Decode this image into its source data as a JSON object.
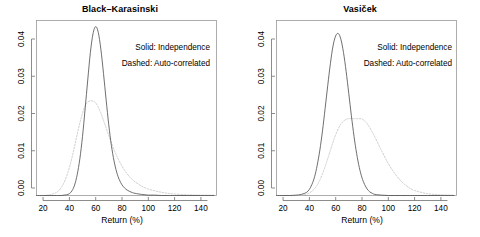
{
  "figure": {
    "background_color": "#ffffff",
    "width": 480,
    "height": 237,
    "panel_count": 2
  },
  "axis": {
    "xlabel": "Return (%)",
    "ylabel": "",
    "x_ticks": [
      "20",
      "40",
      "60",
      "80",
      "100",
      "120",
      "140"
    ],
    "y_ticks": [
      "0.00",
      "0.01",
      "0.02",
      "0.03",
      "0.04"
    ],
    "xlim": [
      15,
      152
    ],
    "ylim": [
      0,
      0.0485
    ],
    "grid": false
  },
  "legend": {
    "position": "top-right-inside",
    "solid_label": "Solid: Independence",
    "dashed_label": "Dashed: Auto-correlated",
    "solid_color": "#555555",
    "dashed_color": "#c9c9c9"
  },
  "chart_data": [
    {
      "type": "line",
      "title": "Black–Karasinski",
      "xlabel": "Return (%)",
      "ylabel": "",
      "xlim": [
        15,
        152
      ],
      "ylim": [
        0,
        0.0485
      ],
      "grid": false,
      "legend_position": "top-right-inside",
      "x": [
        15,
        20,
        25,
        30,
        32,
        34,
        36,
        38,
        40,
        42,
        44,
        46,
        48,
        50,
        52,
        54,
        56,
        58,
        60,
        62,
        64,
        66,
        68,
        70,
        72,
        74,
        76,
        78,
        80,
        82,
        84,
        86,
        88,
        90,
        95,
        100,
        105,
        110,
        115,
        120,
        130,
        140,
        150
      ],
      "series": [
        {
          "name": "Independence",
          "style": "solid",
          "color": "#555555",
          "peak_x": 60,
          "peak_y": 0.0468,
          "values": [
            0.0,
            0.0,
            0.0,
            0.0,
            0.0,
            0.0,
            0.0001,
            0.0002,
            0.0005,
            0.0013,
            0.0029,
            0.0058,
            0.0102,
            0.0163,
            0.024,
            0.032,
            0.0396,
            0.0448,
            0.0468,
            0.0452,
            0.0405,
            0.0338,
            0.0265,
            0.0196,
            0.0139,
            0.0096,
            0.0065,
            0.0044,
            0.003,
            0.0021,
            0.0015,
            0.0011,
            0.0008,
            0.0006,
            0.0003,
            0.0001,
            0.0001,
            0.0,
            0.0,
            0.0,
            0.0,
            0.0,
            0.0
          ]
        },
        {
          "name": "Auto-correlated",
          "style": "dashed",
          "color": "#c9c9c9",
          "peak_x": 58,
          "peak_y": 0.0262,
          "values": [
            0.0,
            0.0,
            0.0002,
            0.0008,
            0.0014,
            0.0023,
            0.0036,
            0.0054,
            0.0077,
            0.0105,
            0.0137,
            0.017,
            0.0201,
            0.0228,
            0.0248,
            0.0259,
            0.0262,
            0.0262,
            0.0257,
            0.0245,
            0.0228,
            0.0208,
            0.0187,
            0.0166,
            0.0146,
            0.0127,
            0.011,
            0.0095,
            0.0082,
            0.007,
            0.006,
            0.0051,
            0.0044,
            0.0038,
            0.0026,
            0.0018,
            0.0013,
            0.0009,
            0.0006,
            0.0004,
            0.0002,
            0.0001,
            0.0001
          ]
        }
      ]
    },
    {
      "type": "line",
      "title": "Vasiček",
      "xlabel": "Return (%)",
      "ylabel": "",
      "xlim": [
        15,
        152
      ],
      "ylim": [
        0,
        0.0485
      ],
      "grid": false,
      "legend_position": "top-right-inside",
      "x": [
        15,
        20,
        25,
        30,
        34,
        38,
        40,
        42,
        44,
        46,
        48,
        50,
        52,
        54,
        56,
        58,
        60,
        62,
        64,
        66,
        68,
        70,
        72,
        74,
        76,
        78,
        80,
        82,
        84,
        86,
        88,
        90,
        95,
        100,
        105,
        110,
        115,
        120,
        130,
        140,
        150
      ],
      "series": [
        {
          "name": "Independence",
          "style": "solid",
          "color": "#555555",
          "peak_x": 62,
          "peak_y": 0.0449,
          "values": [
            0.0,
            0.0,
            0.0,
            0.0001,
            0.0003,
            0.0009,
            0.0017,
            0.0031,
            0.0052,
            0.0084,
            0.0126,
            0.0179,
            0.0241,
            0.0305,
            0.0365,
            0.0414,
            0.0442,
            0.0449,
            0.0433,
            0.0396,
            0.0344,
            0.0283,
            0.0221,
            0.0164,
            0.0116,
            0.0078,
            0.005,
            0.0031,
            0.0018,
            0.001,
            0.0006,
            0.0003,
            0.0001,
            0.0,
            0.0,
            0.0,
            0.0,
            0.0,
            0.0,
            0.0,
            0.0
          ]
        },
        {
          "name": "Auto-correlated",
          "style": "dashed",
          "color": "#c9c9c9",
          "peak_x": 80,
          "peak_y": 0.0213,
          "values": [
            0.0,
            0.0,
            0.0,
            0.0,
            0.0001,
            0.0004,
            0.0007,
            0.0012,
            0.0019,
            0.0029,
            0.0043,
            0.006,
            0.008,
            0.0102,
            0.0125,
            0.0148,
            0.0168,
            0.0185,
            0.0198,
            0.0206,
            0.0211,
            0.0213,
            0.0213,
            0.0213,
            0.0213,
            0.0213,
            0.0212,
            0.0207,
            0.0199,
            0.0188,
            0.0175,
            0.0161,
            0.0124,
            0.0089,
            0.0061,
            0.0039,
            0.0024,
            0.0014,
            0.0005,
            0.0002,
            0.0001
          ]
        }
      ]
    }
  ]
}
